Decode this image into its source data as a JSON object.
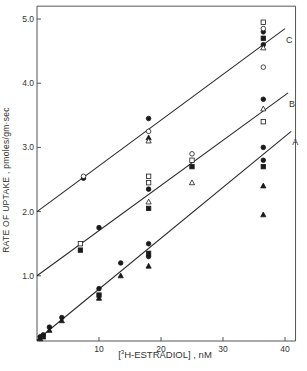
{
  "chart_data": {
    "type": "scatter",
    "title": "",
    "xlabel": "[3H-ESTRADIOL] , nM",
    "ylabel": "RATE OF UPTAKE , pmoles/gm·sec",
    "xlim": [
      0,
      42
    ],
    "ylim": [
      0,
      5.2
    ],
    "x_ticks": [
      10,
      20,
      30,
      40
    ],
    "y_ticks": [
      1.0,
      2.0,
      3.0,
      4.0,
      5.0
    ],
    "grid": false,
    "lines": [
      {
        "name": "A",
        "x": [
          0,
          41
        ],
        "y": [
          0,
          3.25
        ]
      },
      {
        "name": "B",
        "x": [
          0,
          40.5
        ],
        "y": [
          1.0,
          3.85
        ]
      },
      {
        "name": "C",
        "x": [
          0,
          40
        ],
        "y": [
          2.0,
          4.85
        ]
      }
    ],
    "series": [
      {
        "name": "filled circle",
        "marker": "circle-filled",
        "points": [
          [
            0.5,
            0.05
          ],
          [
            1,
            0.08
          ],
          [
            2,
            0.2
          ],
          [
            4,
            0.35
          ],
          [
            10,
            0.8
          ],
          [
            13.5,
            1.2
          ],
          [
            18,
            1.5
          ],
          [
            18,
            1.3
          ],
          [
            36.5,
            3.0
          ],
          [
            36.5,
            2.8
          ],
          [
            10,
            1.75
          ],
          [
            18,
            2.35
          ],
          [
            36.5,
            3.75
          ],
          [
            7.5,
            2.52
          ],
          [
            18,
            3.45
          ],
          [
            36.5,
            4.6
          ],
          [
            36.5,
            4.8
          ]
        ]
      },
      {
        "name": "open circle",
        "marker": "circle-open",
        "points": [
          [
            7.5,
            2.55
          ],
          [
            18,
            3.25
          ],
          [
            25,
            2.9
          ],
          [
            36.5,
            4.25
          ],
          [
            36.5,
            4.85
          ]
        ]
      },
      {
        "name": "filled square",
        "marker": "square-filled",
        "points": [
          [
            1,
            0.05
          ],
          [
            10,
            0.7
          ],
          [
            18,
            1.35
          ],
          [
            36.5,
            2.7
          ],
          [
            7,
            1.4
          ],
          [
            18,
            2.05
          ],
          [
            25,
            2.7
          ],
          [
            36.5,
            4.7
          ]
        ]
      },
      {
        "name": "open square",
        "marker": "square-open",
        "points": [
          [
            7,
            1.5
          ],
          [
            18,
            2.55
          ],
          [
            18,
            2.45
          ],
          [
            25,
            2.8
          ],
          [
            36.5,
            3.4
          ],
          [
            36.5,
            4.95
          ]
        ]
      },
      {
        "name": "filled triangle",
        "marker": "triangle-filled",
        "points": [
          [
            0.5,
            0.02
          ],
          [
            2,
            0.15
          ],
          [
            4,
            0.3
          ],
          [
            10,
            0.65
          ],
          [
            13.5,
            1.0
          ],
          [
            18,
            1.15
          ],
          [
            36.5,
            2.4
          ],
          [
            36.5,
            1.95
          ],
          [
            18,
            3.15
          ]
        ]
      },
      {
        "name": "open triangle",
        "marker": "triangle-open",
        "points": [
          [
            18,
            2.15
          ],
          [
            25,
            2.45
          ],
          [
            36.5,
            3.6
          ],
          [
            18,
            3.1
          ],
          [
            36.5,
            4.55
          ]
        ]
      }
    ],
    "annotations": [
      "A",
      "B",
      "C"
    ]
  },
  "labels": {
    "y_axis": "RATE OF UPTAKE , pmoles/gm·sec",
    "x_axis_pre": "[",
    "x_axis_sup": "3",
    "x_axis_main": "H-ESTRADIOL",
    "x_axis_post": "] , nM"
  }
}
